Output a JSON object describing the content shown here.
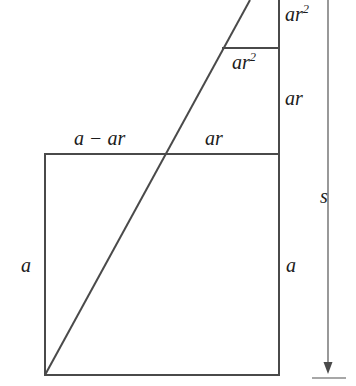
{
  "figure": {
    "colors": {
      "stroke": "#4a4a4a",
      "text": "#1b1b1b",
      "background": "#ffffff"
    },
    "labels": {
      "a_minus_ar": {
        "base": "a − ar",
        "exponent": ""
      },
      "ar_top": {
        "base": "ar",
        "exponent": ""
      },
      "ar_squared_inner": {
        "base": "ar",
        "exponent": "2"
      },
      "ar_squared_outer": {
        "base": "ar",
        "exponent": "2"
      },
      "ar_right": {
        "base": "ar",
        "exponent": ""
      },
      "a_left": {
        "base": "a",
        "exponent": ""
      },
      "a_right": {
        "base": "a",
        "exponent": ""
      },
      "s_measure": {
        "base": "s",
        "exponent": ""
      }
    },
    "geometry": {
      "square": {
        "left": 45,
        "top": 154,
        "right": 279,
        "bottom": 375,
        "side_label": "a"
      },
      "step_line_y": 48,
      "step_line_x_start": 222,
      "step_line_x_end": 279,
      "vertical_right_edge_x": 279,
      "vertical_right_edge_top": 0,
      "diagonal": {
        "x1": 45,
        "y1": 375,
        "x2": 250,
        "y2": 0
      },
      "measure_line": {
        "x": 328,
        "y_top": 0,
        "y_bottom": 370,
        "tick_y": 377,
        "tick_x1": 312,
        "tick_x2": 346
      }
    }
  }
}
